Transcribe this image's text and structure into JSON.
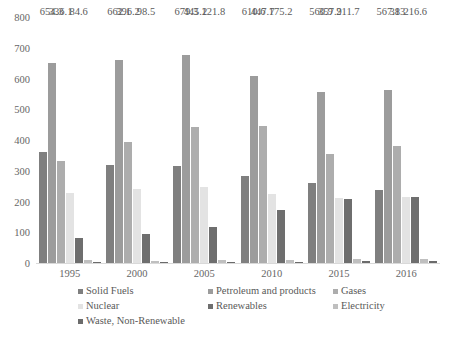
{
  "chart_data": {
    "type": "bar",
    "title": "",
    "xlabel": "",
    "ylabel": "",
    "categories": [
      "1995",
      "2000",
      "2005",
      "2010",
      "2015",
      "2016"
    ],
    "ylim": [
      0,
      800
    ],
    "yticks": [
      0,
      100,
      200,
      300,
      400,
      500,
      600,
      700,
      800
    ],
    "ytick_labels": [
      "0",
      "100",
      "200",
      "300",
      "400",
      "500",
      "600",
      "700",
      "800"
    ],
    "grid": false,
    "legend_position": "bottom",
    "series": [
      {
        "name": "Solid Fuels",
        "color": "#7f7f7f",
        "values": [
          365,
          322,
          318,
          285,
          265,
          240
        ],
        "labels": [
          "",
          "",
          "",
          "",
          "",
          ""
        ]
      },
      {
        "name": "Petroleum and products",
        "color": "#9c9c9c",
        "values": [
          654.3,
          662.1,
          679.3,
          610.6,
          560.9,
          567.1
        ],
        "labels": [
          "654.3",
          "662.1",
          "679.3",
          "610.6",
          "560.9",
          "567.1"
        ]
      },
      {
        "name": "Gases",
        "color": "#adadad",
        "values": [
          336.1,
          396.2,
          445.2,
          447.7,
          357.9,
          383
        ],
        "labels": [
          "336.1",
          "396.2",
          "445.2",
          "447.7",
          "357.9",
          "383"
        ]
      },
      {
        "name": "Nuclear",
        "color": "#e3e3e3",
        "values": [
          230,
          243,
          252,
          228,
          215,
          218
        ],
        "labels": [
          "",
          "",
          "",
          "",
          "",
          ""
        ]
      },
      {
        "name": "Renewables",
        "color": "#6e6e6e",
        "values": [
          84.6,
          98.5,
          121.8,
          175.2,
          211.7,
          216.6
        ],
        "labels": [
          "84.6",
          "98.5",
          "121.8",
          "175.2",
          "211.7",
          "216.6"
        ]
      },
      {
        "name": "Electricity",
        "color": "#bfbfbf",
        "values": [
          12,
          10,
          13,
          14,
          16,
          15
        ],
        "labels": [
          "",
          "",
          "",
          "",
          "",
          ""
        ]
      },
      {
        "name": "Waste, Non-Renewable",
        "color": "#6b6b6b",
        "values": [
          6,
          6,
          7,
          8,
          9,
          9
        ],
        "labels": [
          "",
          "",
          "",
          "",
          "",
          ""
        ]
      }
    ]
  },
  "legend": {
    "rows": [
      [
        {
          "label": "Solid Fuels",
          "color": "#7f7f7f"
        },
        {
          "label": "Petroleum and products",
          "color": "#9c9c9c"
        },
        {
          "label": "Gases",
          "color": "#adadad"
        }
      ],
      [
        {
          "label": "Nuclear",
          "color": "#e3e3e3"
        },
        {
          "label": "Renewables",
          "color": "#6e6e6e"
        },
        {
          "label": "Electricity",
          "color": "#bfbfbf"
        }
      ],
      [
        {
          "label": "Waste, Non-Renewable",
          "color": "#6b6b6b"
        }
      ]
    ]
  }
}
